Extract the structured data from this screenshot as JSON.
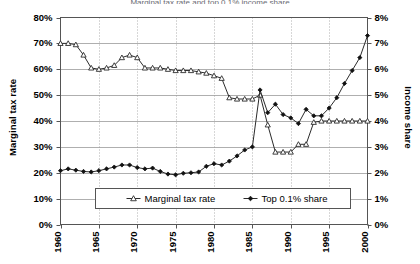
{
  "chart_data": {
    "type": "line",
    "title": "Marginal tax rate and top 0.1% income share",
    "xlabel": "",
    "ylabel": "Marginal tax rate",
    "y2label": "Income share",
    "xlim": [
      1960,
      2000
    ],
    "ylim": [
      0,
      0.8
    ],
    "y2lim": [
      0,
      0.08
    ],
    "grid": true,
    "legend_position": "bottom-center",
    "x": [
      1960,
      1961,
      1962,
      1963,
      1964,
      1965,
      1966,
      1967,
      1968,
      1969,
      1970,
      1971,
      1972,
      1973,
      1974,
      1975,
      1976,
      1977,
      1978,
      1979,
      1980,
      1981,
      1982,
      1983,
      1984,
      1985,
      1986,
      1987,
      1988,
      1989,
      1990,
      1991,
      1992,
      1993,
      1994,
      1995,
      1996,
      1997,
      1998,
      1999,
      2000
    ],
    "x_ticks": [
      "1960",
      "1965",
      "1970",
      "1975",
      "1980",
      "1985",
      "1990",
      "1995",
      "2000"
    ],
    "y_ticks": [
      "0%",
      "10%",
      "20%",
      "30%",
      "40%",
      "50%",
      "60%",
      "70%",
      "80%"
    ],
    "y2_ticks": [
      "0%",
      "1%",
      "2%",
      "3%",
      "4%",
      "5%",
      "6%",
      "7%",
      "8%"
    ],
    "series": [
      {
        "name": "Marginal tax rate",
        "axis": "left",
        "marker": "open-triangle",
        "values": [
          0.7,
          0.7,
          0.695,
          0.655,
          0.605,
          0.6,
          0.605,
          0.615,
          0.645,
          0.655,
          0.645,
          0.605,
          0.605,
          0.605,
          0.6,
          0.595,
          0.595,
          0.595,
          0.59,
          0.585,
          0.575,
          0.565,
          0.49,
          0.485,
          0.485,
          0.485,
          0.5,
          0.385,
          0.28,
          0.28,
          0.28,
          0.31,
          0.31,
          0.395,
          0.4,
          0.4,
          0.4,
          0.4,
          0.4,
          0.4,
          0.4
        ]
      },
      {
        "name": "Top 0.1% share",
        "axis": "right",
        "marker": "filled-diamond",
        "values": [
          0.0208,
          0.0215,
          0.021,
          0.0205,
          0.0203,
          0.0208,
          0.0215,
          0.0222,
          0.023,
          0.023,
          0.022,
          0.0215,
          0.0218,
          0.0205,
          0.0195,
          0.0192,
          0.0198,
          0.02,
          0.0203,
          0.0225,
          0.0235,
          0.023,
          0.0245,
          0.0265,
          0.0288,
          0.03,
          0.052,
          0.0432,
          0.0465,
          0.0425,
          0.0412,
          0.039,
          0.0445,
          0.042,
          0.042,
          0.045,
          0.049,
          0.0545,
          0.0595,
          0.0645,
          0.073
        ]
      }
    ]
  },
  "legend": {
    "items": [
      {
        "label": "Marginal tax rate",
        "marker": "open-triangle"
      },
      {
        "label": "Top 0.1% share",
        "marker": "filled-diamond"
      }
    ]
  },
  "axes": {
    "left_title": "Marginal tax rate",
    "right_title": "Income share"
  }
}
